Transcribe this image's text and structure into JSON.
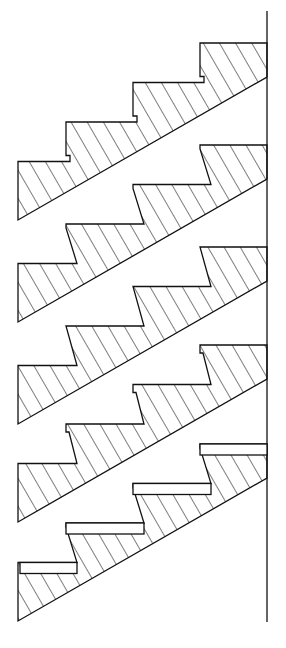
{
  "figure": {
    "colors": {
      "line": "#111111",
      "background": "#ffffff"
    },
    "wall": {
      "x": 267,
      "y_top": 11,
      "y_bottom": 622
    },
    "step": {
      "going": 67,
      "rise": 39.5
    },
    "hatch_spacing": 14,
    "stairs": [
      {
        "name": "notched-nosing",
        "top_y": 43,
        "style": "notch"
      },
      {
        "name": "stepped-riser",
        "top_y": 145,
        "style": "step"
      },
      {
        "name": "sloped-riser",
        "top_y": 247,
        "style": "sloped"
      },
      {
        "name": "lipped-nosing",
        "top_y": 345,
        "style": "lip"
      },
      {
        "name": "plank-treads",
        "top_y": 444,
        "style": "plank"
      }
    ]
  }
}
